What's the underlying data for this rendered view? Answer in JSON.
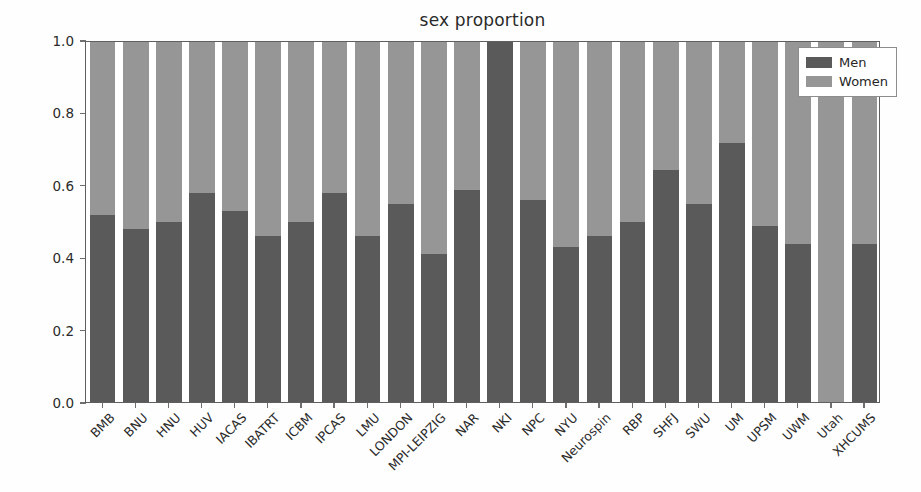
{
  "chart_data": {
    "type": "bar",
    "subtype": "stacked-proportion",
    "title": "sex proportion",
    "xlabel": "",
    "ylabel": "",
    "ylim": [
      0.0,
      1.0
    ],
    "yticks": [
      0.0,
      0.2,
      0.4,
      0.6,
      0.8,
      1.0
    ],
    "ytick_labels": [
      "0.0",
      "0.2",
      "0.4",
      "0.6",
      "0.8",
      "1.0"
    ],
    "grid": false,
    "legend_position": "upper right",
    "categories": [
      "BMB",
      "BNU",
      "HNU",
      "HUV",
      "IACAS",
      "IBATRT",
      "ICBM",
      "IPCAS",
      "LMU",
      "LONDON",
      "MPI-LEIPZIG",
      "NAR",
      "NKI",
      "NPC",
      "NYU",
      "Neurospin",
      "RBP",
      "SHFJ",
      "SWU",
      "UM",
      "UPSM",
      "UWM",
      "Utah",
      "XHCUMS"
    ],
    "series": [
      {
        "name": "Men",
        "color": "#5a5a5a",
        "values": [
          0.52,
          0.48,
          0.5,
          0.58,
          0.53,
          0.46,
          0.5,
          0.58,
          0.46,
          0.55,
          0.41,
          0.59,
          1.0,
          0.56,
          0.43,
          0.46,
          0.5,
          0.645,
          0.55,
          0.72,
          0.49,
          0.44,
          0.0,
          0.44
        ]
      },
      {
        "name": "Women",
        "color": "#969696",
        "values": [
          0.48,
          0.52,
          0.5,
          0.42,
          0.47,
          0.54,
          0.5,
          0.42,
          0.54,
          0.45,
          0.59,
          0.41,
          0.0,
          0.44,
          0.57,
          0.54,
          0.5,
          0.355,
          0.45,
          0.28,
          0.51,
          0.56,
          1.0,
          0.56
        ]
      }
    ]
  },
  "legend": {
    "items": [
      {
        "label": "Men",
        "color": "#5a5a5a"
      },
      {
        "label": "Women",
        "color": "#969696"
      }
    ]
  },
  "colors": {
    "men": "#5a5a5a",
    "women": "#969696",
    "axis": "#5f5f5f",
    "background": "#ffffff",
    "text": "#262626"
  }
}
